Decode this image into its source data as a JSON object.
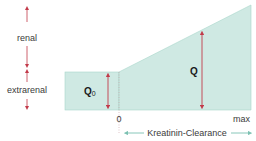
{
  "diagram": {
    "left_labels": {
      "renal": "renal",
      "extrarenal": "extrarenal"
    },
    "areas": {
      "q0_label": "Q",
      "q0_subscript": "0",
      "q_label": "Q"
    },
    "axis": {
      "zero_label": "0",
      "max_label": "max",
      "axis_title": "Kreatinin-Clearance"
    },
    "colors": {
      "fill": "#cfe9e3",
      "stroke": "#9fcfc4",
      "arrow_red": "#c23a4a",
      "arrow_teal": "#7cc1b2",
      "text": "#3a3a3a"
    }
  }
}
